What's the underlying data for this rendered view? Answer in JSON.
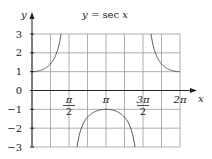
{
  "chart_data": {
    "type": "line",
    "title": "y = sec x",
    "title_parts": {
      "lhs": "y",
      "eq": " = sec ",
      "var": "x"
    },
    "xlabel": "x",
    "ylabel": "y",
    "xlim": [
      0,
      6.283185307
    ],
    "ylim": [
      -3,
      3
    ],
    "grid": true,
    "x_grid_step": 0.785398163,
    "y_grid_step": 1,
    "x_ticks": [
      {
        "value": 1.570796327,
        "num": "π",
        "den": "2"
      },
      {
        "value": 3.141592654,
        "label": "π"
      },
      {
        "value": 4.71238898,
        "num": "3π",
        "den": "2"
      },
      {
        "value": 6.283185307,
        "label": "2π"
      }
    ],
    "y_ticks": [
      {
        "value": 3,
        "label": "3"
      },
      {
        "value": 2,
        "label": "2"
      },
      {
        "value": 1,
        "label": "1"
      },
      {
        "value": 0,
        "label": "0"
      },
      {
        "value": -1,
        "label": "−1"
      },
      {
        "value": -2,
        "label": "−2"
      },
      {
        "value": -3,
        "label": "−3"
      }
    ],
    "series": [
      {
        "name": "y = sec x",
        "function": "sec",
        "domain_segments": [
          [
            0,
            1.231
          ],
          [
            1.9106,
            4.3726
          ],
          [
            5.0522,
            6.283185307
          ]
        ]
      }
    ]
  }
}
